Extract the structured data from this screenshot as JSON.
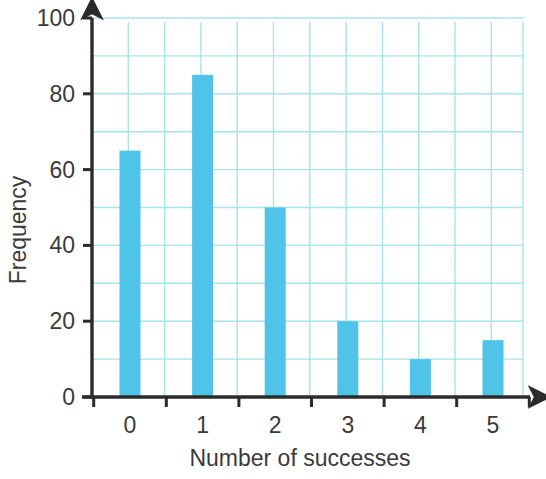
{
  "chart_data": {
    "type": "bar",
    "title": "",
    "subtitle": "",
    "categories": [
      "0",
      "1",
      "2",
      "3",
      "4",
      "5"
    ],
    "values": [
      65,
      85,
      50,
      20,
      10,
      15
    ],
    "xlabel": "Number of successes",
    "ylabel": "Frequency",
    "ylim": [
      0,
      100
    ],
    "xlim": [
      -0.5,
      5.5
    ],
    "y_ticks": [
      0,
      20,
      40,
      60,
      80,
      100
    ],
    "y_tick_labels": [
      "0",
      "20",
      "40",
      "60",
      "80",
      "100"
    ],
    "y_minor_step": 10,
    "x_tick_labels": [
      "0",
      "1",
      "2",
      "3",
      "4",
      "5"
    ],
    "grid": true,
    "grid_orientation": "both",
    "legend": false,
    "legend_position": "none",
    "annotations": [],
    "colors": {
      "bar_fill": "#4FC3E8",
      "grid_line": "#A6E4EE",
      "axis_line": "#2B2B2B",
      "text": "#3a3a3a",
      "background": "#FFFFFF"
    },
    "axis_arrows": {
      "x_axis_arrow": true,
      "y_axis_arrow": true
    }
  }
}
